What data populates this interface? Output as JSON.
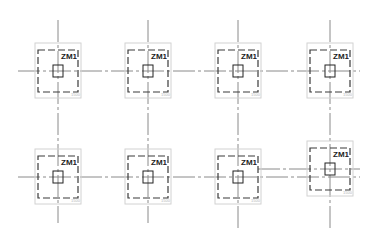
{
  "drawing": {
    "background": "#ffffff",
    "axes": {
      "vertical": [
        {
          "x": 58,
          "y1": 20,
          "y2": 223
        },
        {
          "x": 148,
          "y1": 20,
          "y2": 223
        },
        {
          "x": 238,
          "y1": 20,
          "y2": 228
        },
        {
          "x": 330,
          "y1": 20,
          "y2": 228
        }
      ],
      "horizontal": [
        {
          "y": 71,
          "x1": 18,
          "x2": 360
        },
        {
          "y": 177,
          "x1": 18,
          "x2": 360
        },
        {
          "y": 169,
          "x1": 258,
          "x2": 360
        }
      ]
    },
    "footings": [
      {
        "id": "f1",
        "cx": 58,
        "cy": 71,
        "label": "ZM1",
        "tag": "1500"
      },
      {
        "id": "f2",
        "cx": 148,
        "cy": 71,
        "label": "ZM1",
        "tag": "1500"
      },
      {
        "id": "f3",
        "cx": 238,
        "cy": 71,
        "label": "ZM1",
        "tag": "1500"
      },
      {
        "id": "f4",
        "cx": 330,
        "cy": 71,
        "label": "ZM1",
        "tag": "1500"
      },
      {
        "id": "f5",
        "cx": 58,
        "cy": 177,
        "label": "ZM1",
        "tag": "1500"
      },
      {
        "id": "f6",
        "cx": 148,
        "cy": 177,
        "label": "ZM1",
        "tag": "1500"
      },
      {
        "id": "f7",
        "cx": 238,
        "cy": 177,
        "label": "ZM1",
        "tag": "1500"
      },
      {
        "id": "f8",
        "cx": 330,
        "cy": 169,
        "label": "ZM1",
        "tag": "1500"
      }
    ],
    "geometry": {
      "outer_half_w": 23,
      "outer_top": 28,
      "outer_bottom": 27,
      "dashed_half_w": 20,
      "dashed_top": 21,
      "dashed_bottom": 21,
      "col_half_w": 5,
      "col_half_h": 6
    },
    "colors": {
      "axis": "#8a8a8a",
      "outer": "#d2d2d2",
      "dashed": "#3a3a3a",
      "column": "#222222",
      "label": "#222222"
    }
  }
}
